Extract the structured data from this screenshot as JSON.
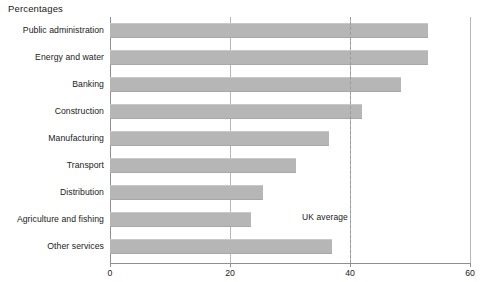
{
  "chart_data": {
    "type": "bar",
    "orientation": "horizontal",
    "title": "Percentages",
    "xlabel": "",
    "ylabel": "",
    "xlim": [
      0,
      60
    ],
    "xticks": [
      0,
      20,
      40,
      60
    ],
    "grid": "vertical",
    "legend": "none",
    "categories": [
      "Public administration",
      "Energy and water",
      "Banking",
      "Construction",
      "Manufacturing",
      "Transport",
      "Distribution",
      "Agriculture and fishing",
      "Other services"
    ],
    "values": [
      53,
      53,
      48.5,
      42,
      36.5,
      31,
      25.5,
      23.5,
      37
    ],
    "annotations": [
      {
        "name": "uk-average",
        "label": "UK average",
        "value": 40,
        "style": "dashed-vertical-line"
      }
    ],
    "colors": {
      "bar_fill": "#b6b6b6",
      "axis": "#8f8f8f",
      "gridline": "#b8b8b8",
      "average_line": "#9a9a9a",
      "text": "#1a1a1a",
      "background": "#ffffff"
    }
  }
}
